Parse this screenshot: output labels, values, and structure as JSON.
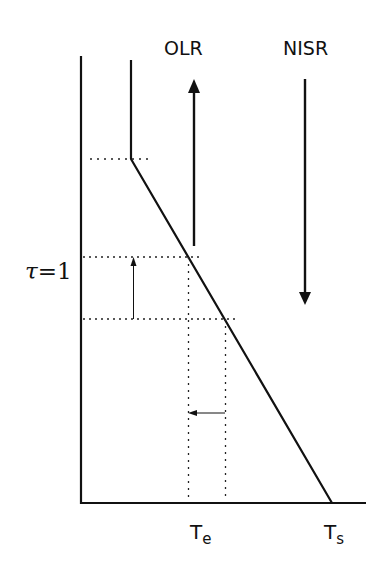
{
  "diagram": {
    "labels": {
      "olr": "OLR",
      "nisr": "NISR",
      "tau_symbol": "τ",
      "tau_equals": "=1",
      "te_main": "T",
      "te_sub": "e",
      "ts_main": "T",
      "ts_sub": "s"
    },
    "colors": {
      "line": "#111111",
      "dotted": "#222222",
      "background": "#ffffff"
    },
    "elements": {
      "y_axis": "vertical axis (optical depth / altitude)",
      "x_axis": "horizontal axis (temperature)",
      "temperature_profile": "stratosphere isothermal segment + tropospheric lapse-rate line",
      "olr_arrow": "upward arrow (outgoing longwave radiation)",
      "nisr_arrow": "downward arrow (net incoming solar radiation)",
      "emission_level_shift_arrow": "small upward arrow showing tau=1 level rising",
      "te_shift_arrow": "small leftward arrow showing emission temperature decreasing"
    }
  }
}
